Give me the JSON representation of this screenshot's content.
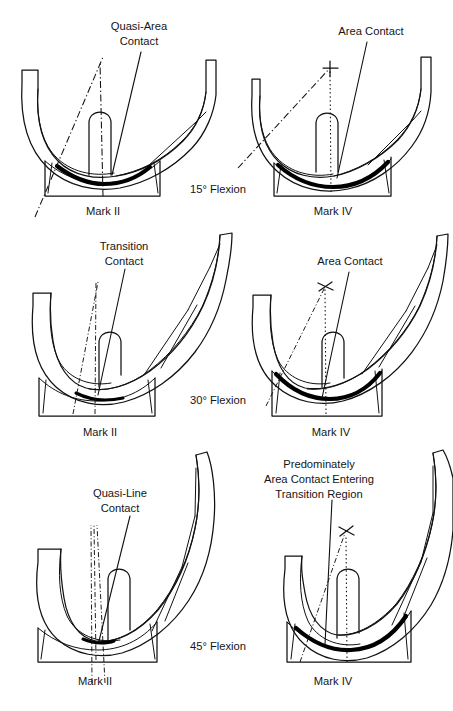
{
  "figure": {
    "background_color": "#ffffff",
    "line_color": "#111111",
    "text_color": "#151515",
    "columns": [
      "Mark II",
      "Mark IV"
    ],
    "rows": [
      {
        "flexion_label": "15° Flexion",
        "panels": [
          {
            "design_label": "Mark II",
            "contact_label_lines": [
              "Quasi-Area",
              "Contact"
            ],
            "has_cross_marker": false
          },
          {
            "design_label": "Mark IV",
            "contact_label_lines": [
              "Area Contact"
            ],
            "has_cross_marker": true
          }
        ]
      },
      {
        "flexion_label": "30° Flexion",
        "panels": [
          {
            "design_label": "Mark II",
            "contact_label_lines": [
              "Transition",
              "Contact"
            ],
            "has_cross_marker": false
          },
          {
            "design_label": "Mark IV",
            "contact_label_lines": [
              "Area Contact"
            ],
            "has_cross_marker": true
          }
        ]
      },
      {
        "flexion_label": "45° Flexion",
        "panels": [
          {
            "design_label": "Mark II",
            "contact_label_lines": [
              "Quasi-Line",
              "Contact"
            ],
            "has_cross_marker": false
          },
          {
            "design_label": "Mark IV",
            "contact_label_lines": [
              "Predominately",
              "Area Contact Entering",
              "Transition Region"
            ],
            "has_cross_marker": true
          }
        ]
      }
    ],
    "labels": {
      "r1c1_contact_1": "Quasi-Area",
      "r1c1_contact_2": "Contact",
      "r1c1_design": "Mark II",
      "r1c2_contact_1": "Area Contact",
      "r1c2_design": "Mark IV",
      "r1_flexion": "15° Flexion",
      "r2c1_contact_1": "Transition",
      "r2c1_contact_2": "Contact",
      "r2c1_design": "Mark II",
      "r2c2_contact_1": "Area Contact",
      "r2c2_design": "Mark IV",
      "r2_flexion": "30° Flexion",
      "r3c1_contact_1": "Quasi-Line",
      "r3c1_contact_2": "Contact",
      "r3c1_design": "Mark II",
      "r3c2_contact_1": "Predominately",
      "r3c2_contact_2": "Area Contact Entering",
      "r3c2_contact_3": "Transition Region",
      "r3c2_design": "Mark IV",
      "r3_flexion": "45° Flexion"
    }
  }
}
